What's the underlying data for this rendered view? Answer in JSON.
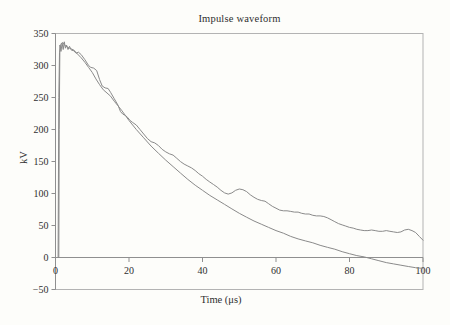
{
  "chart_data": {
    "type": "line",
    "title": "Impulse waveform",
    "xlabel": "Time (μs)",
    "ylabel": "kV",
    "xlim": [
      0,
      100
    ],
    "ylim": [
      -50,
      350
    ],
    "x_ticks": [
      0,
      20,
      40,
      60,
      80,
      100
    ],
    "x_tick_labels": [
      "0",
      "20",
      "40",
      "60",
      "80",
      "100"
    ],
    "y_ticks": [
      350,
      300,
      250,
      200,
      150,
      100,
      50,
      0,
      -50
    ],
    "y_tick_labels": [
      "350",
      "300",
      "250",
      "200",
      "150",
      "100",
      "50",
      "0",
      "−50"
    ],
    "grid": false,
    "legend": "none",
    "zero_axis_line": true,
    "colors": {
      "line": "#8a8a8a",
      "axis": "#8f8f8f",
      "box": "#b3b3b3",
      "text": "#2f2f2f",
      "background": "#fdfdfa"
    },
    "series": [
      {
        "name": "measured-oscillatory-trace",
        "x": [
          0.9,
          1.0,
          1.2,
          1.5,
          1.8,
          2.1,
          2.4,
          2.7,
          3.0,
          3.4,
          3.8,
          4.3,
          5.0,
          5.6,
          6.2,
          7.0,
          8.0,
          9.0,
          9.6,
          10.4,
          11.2,
          12.0,
          12.7,
          13.5,
          14.3,
          15.0,
          16.0,
          17.0,
          17.7,
          18.3,
          19.0,
          19.6,
          20.3,
          21,
          22,
          23,
          24,
          25,
          26,
          27,
          28,
          29,
          30,
          31,
          32,
          33,
          34,
          35,
          36,
          37,
          38,
          39,
          40,
          41,
          42,
          43,
          44,
          45,
          46,
          47,
          48,
          49,
          50,
          51,
          52,
          53,
          54,
          55,
          56,
          57,
          58,
          59,
          60,
          61,
          62,
          63,
          64,
          65,
          66,
          67,
          68,
          69,
          70,
          71,
          72,
          73,
          74,
          75,
          76,
          77,
          78,
          79,
          80,
          81,
          82,
          83,
          84,
          85,
          86,
          87,
          88,
          89,
          90,
          91,
          92,
          93,
          94,
          95,
          96,
          97,
          98,
          99,
          100
        ],
        "y": [
          0,
          200,
          332,
          322,
          335,
          325,
          337,
          327,
          332,
          325,
          330,
          324,
          323,
          319,
          321,
          317,
          309,
          300,
          297,
          296,
          292,
          278,
          268,
          265,
          264,
          258,
          248,
          238,
          228,
          224,
          222,
          219,
          214,
          211,
          207,
          200,
          193,
          186,
          181,
          179,
          175,
          169,
          165,
          162,
          160,
          155,
          150,
          146,
          143,
          140,
          136,
          131,
          127,
          122,
          118,
          114,
          110,
          105,
          101,
          99,
          101,
          105,
          107,
          106,
          103,
          98,
          94,
          91,
          89,
          88,
          84,
          80,
          77,
          74,
          73,
          73,
          72,
          71,
          71,
          69,
          68,
          68,
          66,
          65,
          65,
          64,
          62,
          59,
          56,
          53,
          51,
          49,
          47,
          46,
          44,
          43,
          42,
          42,
          43,
          42,
          41,
          41,
          42,
          41,
          40,
          39,
          40,
          43,
          44,
          42,
          39,
          33,
          27
        ]
      },
      {
        "name": "smooth-impulse-trace",
        "x": [
          0.7,
          0.9,
          1.1,
          1.5,
          2.0,
          2.6,
          3.5,
          5,
          6,
          7,
          8,
          9,
          10,
          11,
          12,
          13,
          14,
          15,
          16,
          17,
          18,
          19,
          20,
          22,
          24,
          26,
          28,
          30,
          32,
          34,
          36,
          38,
          40,
          42,
          44,
          46,
          48,
          50,
          52,
          54,
          56,
          58,
          60,
          62,
          64,
          66,
          68,
          70,
          72,
          74,
          76,
          78,
          80,
          82,
          84,
          86,
          88,
          90,
          92,
          94,
          96,
          98,
          100
        ],
        "y": [
          0,
          250,
          320,
          334,
          336,
          331,
          328,
          324,
          318,
          312,
          305,
          297,
          289,
          279,
          270,
          262,
          257,
          252,
          244,
          237,
          230,
          222,
          214,
          200,
          187,
          174,
          163,
          152,
          142,
          132,
          122,
          113,
          105,
          97,
          90,
          83,
          76,
          69,
          63,
          57,
          52,
          47,
          42,
          38,
          33,
          29,
          26,
          23,
          19,
          16,
          13,
          9,
          6,
          3,
          1,
          -2,
          -5,
          -8,
          -10,
          -12,
          -14,
          -16,
          -17
        ]
      }
    ]
  }
}
